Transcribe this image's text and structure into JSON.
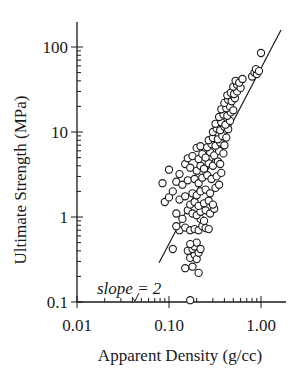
{
  "chart_data": {
    "type": "scatter",
    "title": "",
    "xlabel": "Apparent Density (g/cc)",
    "ylabel": "Ultimate Strength (MPa)",
    "xscale": "log",
    "yscale": "log",
    "xlim": [
      0.01,
      2.0
    ],
    "ylim": [
      0.1,
      180
    ],
    "xticks": [
      0.01,
      0.1,
      1.0
    ],
    "xtick_labels": [
      "0.01",
      "0.10",
      "1.00"
    ],
    "yticks": [
      0.1,
      1,
      10,
      100
    ],
    "ytick_labels": [
      "0.1",
      "1",
      "10",
      "100"
    ],
    "grid": false,
    "legend": null,
    "marker": "open-circle",
    "colors": {
      "ink": "#1a1a1a",
      "background": "#ffffff"
    },
    "annotations": [
      {
        "text": "slope = 2",
        "x": 0.038,
        "y": 0.15,
        "style": "italic"
      }
    ],
    "fit_line": {
      "slope": 2,
      "x": [
        0.078,
        2.05
      ],
      "y": [
        0.29,
        240
      ]
    },
    "points": [
      [
        0.17,
        0.105
      ],
      [
        0.15,
        0.25
      ],
      [
        0.18,
        0.26
      ],
      [
        0.21,
        0.22
      ],
      [
        0.17,
        0.33
      ],
      [
        0.19,
        0.36
      ],
      [
        0.2,
        0.32
      ],
      [
        0.16,
        0.4
      ],
      [
        0.18,
        0.42
      ],
      [
        0.21,
        0.38
      ],
      [
        0.19,
        0.45
      ],
      [
        0.22,
        0.42
      ],
      [
        0.2,
        0.5
      ],
      [
        0.17,
        0.48
      ],
      [
        0.11,
        0.42
      ],
      [
        0.13,
        0.7
      ],
      [
        0.15,
        0.75
      ],
      [
        0.12,
        0.78
      ],
      [
        0.17,
        0.7
      ],
      [
        0.19,
        0.72
      ],
      [
        0.21,
        0.7
      ],
      [
        0.23,
        0.78
      ],
      [
        0.25,
        0.74
      ],
      [
        0.27,
        0.72
      ],
      [
        0.22,
        0.95
      ],
      [
        0.24,
        0.9
      ],
      [
        0.14,
        0.95
      ],
      [
        0.12,
        1.1
      ],
      [
        0.16,
        1.2
      ],
      [
        0.18,
        1.1
      ],
      [
        0.2,
        1.05
      ],
      [
        0.22,
        1.15
      ],
      [
        0.25,
        1.2
      ],
      [
        0.28,
        1.1
      ],
      [
        0.31,
        1.25
      ],
      [
        0.17,
        1.4
      ],
      [
        0.19,
        1.5
      ],
      [
        0.21,
        1.35
      ],
      [
        0.24,
        1.45
      ],
      [
        0.27,
        1.55
      ],
      [
        0.3,
        1.4
      ],
      [
        0.09,
        1.5
      ],
      [
        0.1,
        1.7
      ],
      [
        0.11,
        2.0
      ],
      [
        0.13,
        1.6
      ],
      [
        0.15,
        1.75
      ],
      [
        0.18,
        1.9
      ],
      [
        0.2,
        1.8
      ],
      [
        0.22,
        2.0
      ],
      [
        0.25,
        2.1
      ],
      [
        0.28,
        1.9
      ],
      [
        0.32,
        2.2
      ],
      [
        0.35,
        2.4
      ],
      [
        0.085,
        2.5
      ],
      [
        0.12,
        2.6
      ],
      [
        0.14,
        2.4
      ],
      [
        0.16,
        2.7
      ],
      [
        0.19,
        2.8
      ],
      [
        0.21,
        2.5
      ],
      [
        0.23,
        2.9
      ],
      [
        0.26,
        3.1
      ],
      [
        0.29,
        2.8
      ],
      [
        0.33,
        3.0
      ],
      [
        0.37,
        3.3
      ],
      [
        0.1,
        3.6
      ],
      [
        0.13,
        3.2
      ],
      [
        0.15,
        4.2
      ],
      [
        0.17,
        3.8
      ],
      [
        0.2,
        3.5
      ],
      [
        0.22,
        4.0
      ],
      [
        0.24,
        3.7
      ],
      [
        0.27,
        4.3
      ],
      [
        0.3,
        4.0
      ],
      [
        0.34,
        4.5
      ],
      [
        0.36,
        4.2
      ],
      [
        0.16,
        4.9
      ],
      [
        0.18,
        5.2
      ],
      [
        0.21,
        4.8
      ],
      [
        0.23,
        5.5
      ],
      [
        0.25,
        5.0
      ],
      [
        0.28,
        5.8
      ],
      [
        0.31,
        5.3
      ],
      [
        0.35,
        6.0
      ],
      [
        0.39,
        5.6
      ],
      [
        0.2,
        6.5
      ],
      [
        0.22,
        6.8
      ],
      [
        0.26,
        6.6
      ],
      [
        0.29,
        7.2
      ],
      [
        0.32,
        6.9
      ],
      [
        0.36,
        7.5
      ],
      [
        0.4,
        7.0
      ],
      [
        0.27,
        8.0
      ],
      [
        0.3,
        8.5
      ],
      [
        0.34,
        8.2
      ],
      [
        0.38,
        9.0
      ],
      [
        0.42,
        8.6
      ],
      [
        0.3,
        10
      ],
      [
        0.33,
        11
      ],
      [
        0.36,
        10.5
      ],
      [
        0.4,
        11.5
      ],
      [
        0.44,
        10.8
      ],
      [
        0.32,
        12.5
      ],
      [
        0.37,
        13
      ],
      [
        0.41,
        12.2
      ],
      [
        0.46,
        13.5
      ],
      [
        0.35,
        15
      ],
      [
        0.39,
        16
      ],
      [
        0.43,
        15.5
      ],
      [
        0.47,
        17
      ],
      [
        0.37,
        18.5
      ],
      [
        0.42,
        19
      ],
      [
        0.46,
        20
      ],
      [
        0.5,
        18
      ],
      [
        0.4,
        22
      ],
      [
        0.44,
        24
      ],
      [
        0.48,
        23
      ],
      [
        0.52,
        25
      ],
      [
        0.43,
        27
      ],
      [
        0.47,
        29
      ],
      [
        0.51,
        28
      ],
      [
        0.55,
        30
      ],
      [
        0.5,
        34
      ],
      [
        0.55,
        36
      ],
      [
        0.6,
        33
      ],
      [
        0.53,
        40
      ],
      [
        0.58,
        38
      ],
      [
        0.63,
        42
      ],
      [
        0.8,
        45
      ],
      [
        0.85,
        50
      ],
      [
        0.9,
        48
      ],
      [
        0.88,
        55
      ],
      [
        0.95,
        52
      ],
      [
        1.0,
        85
      ]
    ]
  }
}
